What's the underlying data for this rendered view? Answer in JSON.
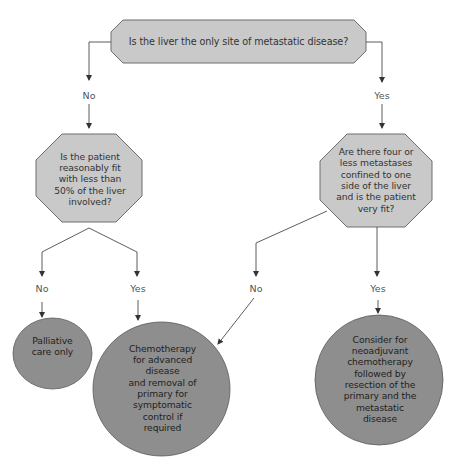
{
  "colors": {
    "decision_fill": "#c9c9c9",
    "decision_stroke": "#6e6e6e",
    "outcome_fill": "#8e8e8e",
    "outcome_stroke": "#5a5a5a",
    "connector": "#333333",
    "text": "#333333"
  },
  "nodes": {
    "root_question": {
      "type": "decision",
      "text": "Is the liver the only site of metastatic disease?"
    },
    "left_question": {
      "type": "decision",
      "text": "Is the patient\nreasonably fit\nwith less than\n50% of the liver\ninvolved?"
    },
    "right_question": {
      "type": "decision",
      "text": "Are there four or\nless metastases\nconfined to one\nside of the liver\nand is the patient\nvery fit?"
    },
    "palliative": {
      "type": "outcome",
      "text": "Palliative\ncare only"
    },
    "chemo_advanced": {
      "type": "outcome",
      "text": "Chemotherapy\nfor advanced\ndisease\nand removal of\nprimary for\nsymptomatic\ncontrol if\nrequired"
    },
    "neoadjuvant": {
      "type": "outcome",
      "text": "Consider for\nneoadjuvant\nchemotherapy\nfollowed by\nresection of the\nprimary and the\nmetastatic\ndisease"
    }
  },
  "edges": [
    {
      "from": "root_question",
      "to": "left_question",
      "label": "No"
    },
    {
      "from": "root_question",
      "to": "right_question",
      "label": "Yes"
    },
    {
      "from": "left_question",
      "to": "palliative",
      "label": "No"
    },
    {
      "from": "left_question",
      "to": "chemo_advanced",
      "label": "Yes"
    },
    {
      "from": "right_question",
      "to": "chemo_advanced",
      "label": "No"
    },
    {
      "from": "right_question",
      "to": "neoadjuvant",
      "label": "Yes"
    }
  ]
}
